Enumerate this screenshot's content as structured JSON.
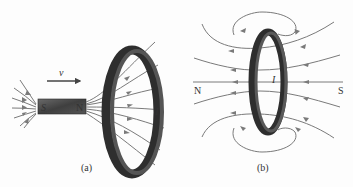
{
  "figure": {
    "panel_a": {
      "caption": "(a)",
      "velocity_label": "v",
      "magnet_south": "S",
      "magnet_north": "N",
      "current_label": "I"
    },
    "panel_b": {
      "caption": "(b)",
      "north_label": "N",
      "south_label": "S",
      "current_label": "I"
    },
    "colors": {
      "field_line": "#7a7a7a",
      "ring": "#3a3a3a",
      "magnet": "#4a4a4a",
      "text": "#333333"
    }
  }
}
